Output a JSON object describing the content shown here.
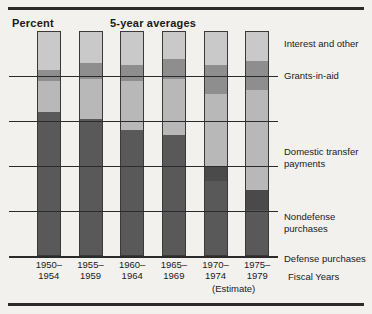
{
  "header": {
    "y_axis_title": "Percent",
    "chart_note": "5-year averages",
    "x_axis_title": "Fiscal Years",
    "estimate_note": "(Estimate)"
  },
  "chart_data": {
    "type": "bar",
    "stacked": true,
    "title": "5-year averages",
    "xlabel": "Fiscal Years",
    "ylabel": "Percent",
    "ylim": [
      0,
      100
    ],
    "yticks": [
      0,
      20,
      40,
      60,
      80
    ],
    "ytick_labels": [
      "0",
      "20",
      "40",
      "60",
      "80"
    ],
    "grid": true,
    "legend_position": "right",
    "categories": [
      "1950–\n1954",
      "1955–\n1959",
      "1960–\n1964",
      "1965–\n1969",
      "1970–\n1974",
      "1975–\n1979"
    ],
    "category_lines": [
      [
        "1950–",
        "1954"
      ],
      [
        "1955–",
        "1959"
      ],
      [
        "1960–",
        "1964"
      ],
      [
        "1965–",
        "1969"
      ],
      [
        "1970–",
        "1974"
      ],
      [
        "1975–",
        "1979"
      ]
    ],
    "series": [
      {
        "name": "Defense purchases",
        "color": "#595959",
        "values": [
          64,
          61,
          56,
          54,
          40,
          29
        ]
      },
      {
        "name": "Nondefense purchases",
        "color": "#6f6f6f",
        "values": [
          0,
          0,
          0,
          0,
          0,
          0
        ]
      },
      {
        "name": "Domestic transfer payments",
        "color": "#b8b8b8",
        "values": [
          14,
          18,
          22,
          25,
          32,
          45
        ]
      },
      {
        "name": "Grants-in-aid",
        "color": "#8e8e8e",
        "values": [
          5,
          7,
          7,
          9,
          13,
          13
        ]
      },
      {
        "name": "Interest and other",
        "color": "#c9c9c9",
        "values": [
          17,
          14,
          15,
          12,
          15,
          13
        ]
      }
    ],
    "stack_breaks": [
      [
        64,
        64,
        78,
        83,
        100
      ],
      [
        61,
        61,
        79,
        86,
        100
      ],
      [
        56,
        56,
        78,
        85,
        100
      ],
      [
        54,
        54,
        79,
        88,
        100
      ],
      [
        33,
        40,
        72,
        85,
        100
      ],
      [
        20,
        29,
        74,
        87,
        100
      ]
    ],
    "segment_names": [
      "Defense purchases",
      "Nondefense purchases",
      "Domestic transfer payments",
      "Grants-in-aid",
      "Interest and other"
    ],
    "segment_colors": [
      "#595959",
      "#4a4a4a",
      "#b8b8b8",
      "#8e8e8e",
      "#c9c9c9"
    ]
  },
  "legend": [
    {
      "label": "Interest and other",
      "top": 7
    },
    {
      "label": "Grants-in-aid",
      "top": 39
    },
    {
      "label": "Domestic transfer",
      "top": 115
    },
    {
      "label": "payments",
      "top": 127
    },
    {
      "label": "Nondefense",
      "top": 180
    },
    {
      "label": "purchases",
      "top": 192
    },
    {
      "label": "Defense purchases",
      "top": 222
    }
  ],
  "colors": {
    "background": "#f2f1ee",
    "ink": "#2b2b2b",
    "defense": "#595959",
    "nondefense": "#4a4a4a",
    "domestic": "#b8b8b8",
    "grants": "#8e8e8e",
    "interest": "#c9c9c9"
  }
}
